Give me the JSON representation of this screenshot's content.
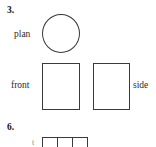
{
  "page": {
    "background_color": "#ffffff",
    "stroke_color": "#3a3a3a",
    "text_color": "#1c1c1c",
    "width": 156,
    "height": 147
  },
  "questions": [
    {
      "number": "3.",
      "views": {
        "plan_label": "plan",
        "front_label": "front",
        "side_label": "side"
      },
      "shapes": {
        "plan_shape": "circle",
        "front_shape": "rectangle",
        "side_shape": "rectangle"
      }
    },
    {
      "number": "6.",
      "partial": true,
      "grid": {
        "cells": [
          "",
          "",
          ""
        ],
        "stub_text": "t"
      }
    }
  ]
}
